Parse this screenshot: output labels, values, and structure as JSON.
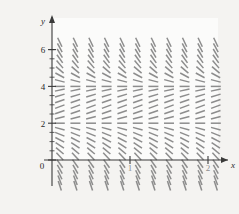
{
  "figure": {
    "name": "direction-field",
    "background": "#f4f3f1",
    "plot_background": "#fbfbfa"
  },
  "chart_data": {
    "type": "scatter",
    "subtype": "direction-field",
    "title": "",
    "subtitle": "",
    "xlabel": "x",
    "ylabel": "y",
    "xlim": [
      -0.15,
      2.35
    ],
    "ylim": [
      -1.6,
      6.7
    ],
    "grid": false,
    "legend": null,
    "annotations": [],
    "axis_color": "#3a3a3a",
    "segment_color": "#8d8d8d",
    "xticks": [
      0,
      1,
      2
    ],
    "xtick_labels": [
      "0",
      "1",
      "2"
    ],
    "yticks": [
      0,
      2,
      4,
      6
    ],
    "ytick_labels": [
      "0",
      "2",
      "4",
      "6"
    ],
    "y_minor_ticks": [
      0.5,
      1,
      1.5,
      2.5,
      3,
      3.5,
      4.5,
      5,
      5.5,
      6
    ],
    "equilibria": [
      2,
      4
    ],
    "x_samples": [
      0.1,
      0.3,
      0.5,
      0.7,
      0.9,
      1.1,
      1.3,
      1.5,
      1.7,
      1.9,
      2.1,
      2.3
    ],
    "y_samples": [
      -1.4,
      -1.1,
      -0.8,
      -0.5,
      -0.2,
      0.2,
      0.5,
      0.8,
      1.1,
      1.4,
      1.7,
      2.0,
      2.3,
      2.6,
      2.9,
      3.2,
      3.5,
      3.8,
      4.0,
      4.3,
      4.6,
      4.9,
      5.2,
      5.5,
      5.8,
      6.1,
      6.4
    ],
    "slope_rule": "dy/dx proportional to (y-2)(y-4), horizontal at y=2 and y=4, positive between 2 and 4 is negative slope, steep outside",
    "slope_rows": [
      {
        "y": 6.4,
        "slope": -9.0,
        "description": "near vertical descending"
      },
      {
        "y": 6.1,
        "slope": -8.0,
        "description": "near vertical descending"
      },
      {
        "y": 5.8,
        "slope": -7.0,
        "description": "near vertical descending"
      },
      {
        "y": 5.5,
        "slope": -6.0,
        "description": "steep descending"
      },
      {
        "y": 5.2,
        "slope": -5.0,
        "description": "steep descending"
      },
      {
        "y": 4.9,
        "slope": -3.6,
        "description": "steep descending"
      },
      {
        "y": 4.6,
        "slope": -2.3,
        "description": "descending"
      },
      {
        "y": 4.3,
        "slope": -1.1,
        "description": "descending"
      },
      {
        "y": 4.0,
        "slope": 0.0,
        "description": "horizontal equilibrium"
      },
      {
        "y": 3.8,
        "slope": 0.9,
        "description": "ascending"
      },
      {
        "y": 3.5,
        "slope": 1.3,
        "description": "ascending"
      },
      {
        "y": 3.2,
        "slope": 1.5,
        "description": "ascending"
      },
      {
        "y": 2.9,
        "slope": 1.55,
        "description": "ascending peak"
      },
      {
        "y": 2.6,
        "slope": 1.5,
        "description": "ascending"
      },
      {
        "y": 2.3,
        "slope": 1.1,
        "description": "ascending"
      },
      {
        "y": 2.0,
        "slope": 0.0,
        "description": "horizontal equilibrium"
      },
      {
        "y": 1.7,
        "slope": -1.2,
        "description": "descending"
      },
      {
        "y": 1.4,
        "slope": -1.7,
        "description": "descending"
      },
      {
        "y": 1.1,
        "slope": -2.2,
        "description": "descending"
      },
      {
        "y": 0.8,
        "slope": -2.8,
        "description": "steep descending"
      },
      {
        "y": 0.5,
        "slope": -3.6,
        "description": "steep descending"
      },
      {
        "y": 0.2,
        "slope": -4.6,
        "description": "steep descending"
      },
      {
        "y": -0.2,
        "slope": -6.0,
        "description": "near vertical descending"
      },
      {
        "y": -0.5,
        "slope": -7.5,
        "description": "near vertical descending"
      },
      {
        "y": -0.8,
        "slope": -9.0,
        "description": "near vertical descending"
      },
      {
        "y": -1.1,
        "slope": -11.0,
        "description": "near vertical descending"
      },
      {
        "y": -1.4,
        "slope": -13.0,
        "description": "near vertical descending"
      }
    ]
  }
}
